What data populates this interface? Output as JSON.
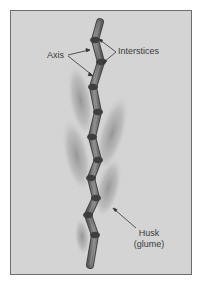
{
  "diagram": {
    "labels": {
      "axis": "Axis",
      "interstices": "Interstices",
      "husk_line1": "Husk",
      "husk_line2": "(glume)"
    },
    "colors": {
      "background": "#d4d4d4",
      "frame_border": "#6e6e6e",
      "stem_fill": "#7a7a7a",
      "stem_dark": "#4a4a4a",
      "husk": "#9a9a9a",
      "text": "#3a3a3a",
      "leader_line": "#333333"
    }
  }
}
